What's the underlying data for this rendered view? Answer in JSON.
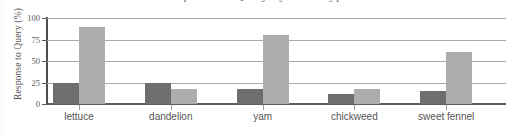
{
  "figure": {
    "title_partial": "Response to Query by Plant Type",
    "background_color": "#ffffff"
  },
  "chart_data": {
    "type": "bar",
    "title": "Response to Query by Plant Type",
    "xlabel": "",
    "ylabel": "Response to Query (%)",
    "categories": [
      "lettuce",
      "dandelion",
      "yam",
      "chickweed",
      "sweet fennel"
    ],
    "series": [
      {
        "name": "series-a",
        "color": "#6e6e6e",
        "values": [
          25,
          25,
          17,
          12,
          15
        ]
      },
      {
        "name": "series-b",
        "color": "#adadad",
        "values": [
          90,
          17,
          80,
          17,
          60
        ]
      }
    ],
    "ylim": [
      0,
      100
    ],
    "yticks": [
      0,
      25,
      50,
      75,
      100
    ],
    "ytick_labels": [
      "0",
      "25",
      "50",
      "75",
      "100"
    ],
    "grid": true,
    "grid_axis": "y",
    "legend": false,
    "legend_position": "none",
    "bar_group_gap": true,
    "axis_color": "#5d5d5d",
    "grid_color": "#a9a9a9",
    "text_color": "#555555"
  },
  "axes": {
    "y_title": "Response to Query (%)",
    "y_ticks": [
      {
        "label": "100",
        "value": 100
      },
      {
        "label": "75",
        "value": 75
      },
      {
        "label": "50",
        "value": 50
      },
      {
        "label": "25",
        "value": 25
      },
      {
        "label": "0",
        "value": 0
      }
    ]
  }
}
